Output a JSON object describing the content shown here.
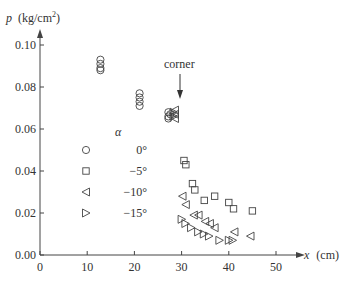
{
  "chart_data": {
    "type": "scatter",
    "title": "",
    "xlabel": "x (cm)",
    "ylabel": "p (kg/cm²)",
    "xlim": [
      0,
      55
    ],
    "ylim": [
      0,
      0.11
    ],
    "x_ticks": [
      0,
      10,
      20,
      30,
      40,
      50
    ],
    "x_tick_labels": [
      "0",
      "10",
      "20",
      "30",
      "40",
      "50"
    ],
    "y_ticks": [
      0.0,
      0.02,
      0.04,
      0.06,
      0.08,
      0.1
    ],
    "y_tick_labels": [
      "0.00",
      "0.02",
      "0.04",
      "0.06",
      "0.08",
      "0.10"
    ],
    "grid": false,
    "legend_title": "α",
    "legend_position": "inside-left",
    "annotations": [
      {
        "text": "corner",
        "x": 29.5,
        "y": 0.083,
        "arrow_to": [
          29.5,
          0.071
        ]
      }
    ],
    "series": [
      {
        "name": "0°",
        "marker": "circle",
        "points": [
          [
            12.8,
            0.093
          ],
          [
            12.8,
            0.091
          ],
          [
            12.8,
            0.089
          ],
          [
            12.8,
            0.088
          ],
          [
            21.1,
            0.077
          ],
          [
            21.1,
            0.075
          ],
          [
            21.1,
            0.073
          ],
          [
            21.1,
            0.071
          ],
          [
            27.2,
            0.068
          ],
          [
            27.2,
            0.066
          ],
          [
            27.2,
            0.065
          ],
          [
            27.6,
            0.067
          ]
        ]
      },
      {
        "name": "−5°",
        "marker": "square",
        "points": [
          [
            30.5,
            0.045
          ],
          [
            30.9,
            0.043
          ],
          [
            32.3,
            0.034
          ],
          [
            32.8,
            0.031
          ],
          [
            34.8,
            0.026
          ],
          [
            37.0,
            0.028
          ],
          [
            40.0,
            0.025
          ],
          [
            41.0,
            0.022
          ],
          [
            45.0,
            0.021
          ]
        ]
      },
      {
        "name": "−10°",
        "marker": "triangle-left",
        "points": [
          [
            28.6,
            0.069
          ],
          [
            28.6,
            0.067
          ],
          [
            28.6,
            0.065
          ],
          [
            30.2,
            0.028
          ],
          [
            30.9,
            0.024
          ],
          [
            32.6,
            0.019
          ],
          [
            33.6,
            0.019
          ],
          [
            35.0,
            0.016
          ],
          [
            36.0,
            0.015
          ],
          [
            37.0,
            0.013
          ],
          [
            41.2,
            0.011
          ],
          [
            44.6,
            0.009
          ]
        ]
      },
      {
        "name": "−15°",
        "marker": "triangle-right",
        "points": [
          [
            28.3,
            0.068
          ],
          [
            28.3,
            0.066
          ],
          [
            30.0,
            0.017
          ],
          [
            30.8,
            0.015
          ],
          [
            32.0,
            0.013
          ],
          [
            33.5,
            0.011
          ],
          [
            34.7,
            0.01
          ],
          [
            35.8,
            0.009
          ],
          [
            38.0,
            0.007
          ],
          [
            40.0,
            0.007
          ],
          [
            40.8,
            0.007
          ]
        ]
      }
    ]
  },
  "labels": {
    "ylabel_main": "p",
    "ylabel_unit": "(kg/cm",
    "ylabel_sup": "2",
    "ylabel_close": ")",
    "xlabel_main": "x",
    "xlabel_unit": "(cm)",
    "corner": "corner",
    "legend_title": "α"
  }
}
